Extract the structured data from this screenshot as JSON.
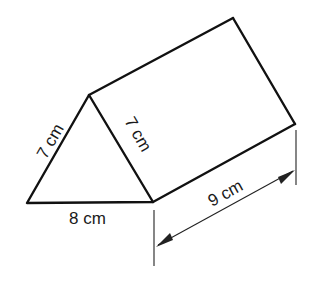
{
  "figure": {
    "type": "triangular prism",
    "triangle_face": {
      "left_side": "7 cm",
      "right_side": "7 cm",
      "base": "8 cm"
    },
    "length_dimension": "9 cm"
  },
  "colors": {
    "line": "#111111",
    "background": "#ffffff"
  }
}
